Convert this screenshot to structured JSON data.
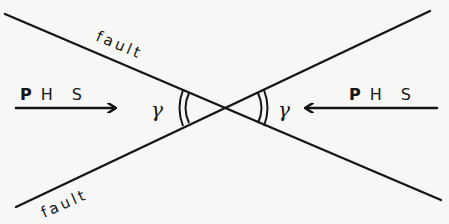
{
  "diagram": {
    "type": "conjugate-fault-stress-diagram",
    "colors": {
      "background": "#f7f7f5",
      "ink": "#151515"
    },
    "faults": [
      {
        "label": "fault",
        "from": [
          5,
          14
        ],
        "to": [
          441,
          200
        ]
      },
      {
        "label": "fault",
        "from": [
          16,
          207
        ],
        "to": [
          430,
          11
        ]
      }
    ],
    "intersection": [
      224,
      108
    ],
    "stress_arrows": [
      {
        "label": "P H S",
        "label_parts": [
          "P",
          "H",
          "S"
        ],
        "direction": "right",
        "from": [
          16,
          108
        ],
        "to": [
          115,
          108
        ]
      },
      {
        "label": "P H S",
        "label_parts": [
          "P",
          "H",
          "S"
        ],
        "direction": "left",
        "from": [
          437,
          108
        ],
        "to": [
          305,
          108
        ]
      }
    ],
    "angles": [
      {
        "symbol": "γ",
        "side": "left",
        "arc": "double"
      },
      {
        "symbol": "γ",
        "side": "right",
        "arc": "double"
      }
    ]
  },
  "labels": {
    "fault_top": "fault",
    "fault_bottom": "fault",
    "phs_left_p": "P",
    "phs_left_hs": "H S",
    "phs_right_p": "P",
    "phs_right_hs": "H S",
    "gamma_left": "γ",
    "gamma_right": "γ"
  }
}
